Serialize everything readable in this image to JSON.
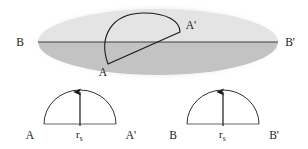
{
  "figure": {
    "background_color": "#ffffff",
    "line_color": "#1a1a1a",
    "ellipse_top_fill": "#e4e4e4",
    "ellipse_bottom_fill": "#c3c3c3",
    "ellipse_edge_fill": "#efefef"
  },
  "top_panel": {
    "name": "ellipsoid-panel",
    "labels": {
      "b_left": "B",
      "b_right": "B'",
      "a_lower": "A",
      "a_upper": "A'"
    },
    "ellipse": {
      "center_x": 158,
      "center_y": 42,
      "radius_x": 120,
      "radius_y": 33
    },
    "major_axis": {
      "x1": 38,
      "y1": 42,
      "x2": 278,
      "y2": 42
    },
    "chord": {
      "x1": 108,
      "y1": 64,
      "x2": 180,
      "y2": 32
    },
    "arc": {
      "start_x": 108,
      "start_y": 64,
      "end_x": 180,
      "end_y": 32,
      "apex_x": 144,
      "apex_y": 15
    }
  },
  "bottom_left_panel": {
    "name": "semicircle-panel-a",
    "labels": {
      "left": "A",
      "right": "A'",
      "radius": "r",
      "radius_subscript": "s"
    },
    "baseline": {
      "x1": 44,
      "y1": 124,
      "x2": 116,
      "y2": 124
    },
    "semicircle": {
      "center_x": 80,
      "center_y": 124,
      "radius": 36
    },
    "arrow": {
      "x": 80,
      "y_base": 124,
      "y_tip": 90
    }
  },
  "bottom_right_panel": {
    "name": "semicircle-panel-b",
    "labels": {
      "left": "B",
      "right": "B'",
      "radius": "r",
      "radius_subscript": "s"
    },
    "baseline": {
      "x1": 187,
      "y1": 124,
      "x2": 259,
      "y2": 124
    },
    "semicircle": {
      "center_x": 223,
      "center_y": 124,
      "radius": 36
    },
    "arrow": {
      "x": 223,
      "y_base": 124,
      "y_tip": 90
    }
  }
}
